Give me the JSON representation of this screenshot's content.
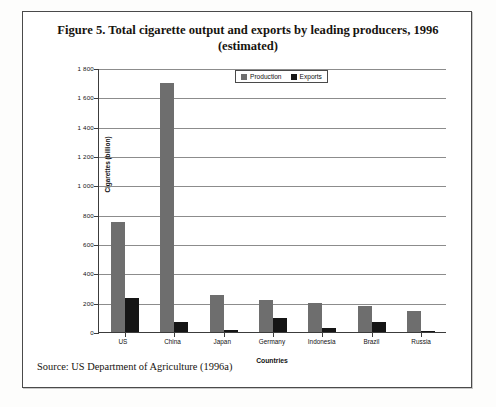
{
  "figure": {
    "title": "Figure 5. Total cigarette output and exports by leading producers, 1996 (estimated)",
    "source": "Source: US Department of Agriculture (1996a)"
  },
  "chart_data": {
    "type": "bar",
    "title": "Figure 5. Total cigarette output and exports by leading producers, 1996 (estimated)",
    "xlabel": "Countries",
    "ylabel": "Cigarettes (billion)",
    "ylim": [
      0,
      1800
    ],
    "ytick_step": 200,
    "ytick_labels": [
      "0",
      "200",
      "400",
      "600",
      "800",
      "1 000",
      "1 200",
      "1 400",
      "1 600",
      "1 800"
    ],
    "grid": true,
    "legend_position": "top-center-inside",
    "categories": [
      "US",
      "China",
      "Japan",
      "Germany",
      "Indonesia",
      "Brazil",
      "Russia"
    ],
    "series": [
      {
        "name": "Production",
        "color": "#6e6e6e",
        "values": [
          750,
          1700,
          255,
          220,
          200,
          180,
          145
        ]
      },
      {
        "name": "Exports",
        "color": "#151515",
        "values": [
          235,
          65,
          15,
          95,
          25,
          70,
          8
        ]
      }
    ]
  }
}
